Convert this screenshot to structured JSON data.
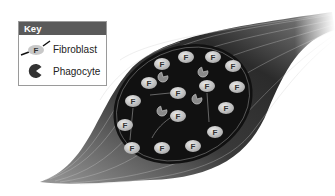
{
  "key": {
    "title": "Key",
    "items": [
      {
        "symbol": "fibroblast-icon",
        "symbol_letter": "F",
        "label": "Fibroblast"
      },
      {
        "symbol": "phagocyte-icon",
        "label": "Phagocyte"
      }
    ]
  },
  "diagram": {
    "fibroblast_letter": "F",
    "fibroblasts": [
      {
        "x": 162,
        "y": 64
      },
      {
        "x": 186,
        "y": 57
      },
      {
        "x": 213,
        "y": 57
      },
      {
        "x": 233,
        "y": 66
      },
      {
        "x": 149,
        "y": 83
      },
      {
        "x": 207,
        "y": 86
      },
      {
        "x": 237,
        "y": 87
      },
      {
        "x": 178,
        "y": 93
      },
      {
        "x": 133,
        "y": 101
      },
      {
        "x": 226,
        "y": 108
      },
      {
        "x": 178,
        "y": 116
      },
      {
        "x": 125,
        "y": 125
      },
      {
        "x": 215,
        "y": 132
      },
      {
        "x": 132,
        "y": 148
      },
      {
        "x": 162,
        "y": 148
      },
      {
        "x": 193,
        "y": 146
      }
    ],
    "phagocytes": [
      {
        "x": 163,
        "y": 77
      },
      {
        "x": 203,
        "y": 72
      },
      {
        "x": 197,
        "y": 99
      },
      {
        "x": 162,
        "y": 111
      }
    ],
    "colors": {
      "core": "#111111",
      "fiber_dark": "#2a2a2a",
      "fiber_light": "#bdbdbd",
      "cell_fill": "#d4d4d4",
      "key_header": "#5a5a5a"
    }
  }
}
